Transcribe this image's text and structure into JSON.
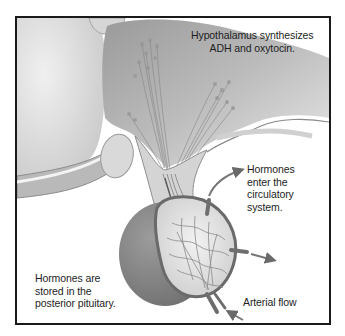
{
  "figure": {
    "labels": {
      "hypothalamus": [
        "Hypothalamus synthesizes",
        "ADH  and oxytocin."
      ],
      "circulatory": [
        "Hormones",
        "enter the",
        "circulatory",
        "system."
      ],
      "stored": [
        "Hormones are",
        "stored in  the",
        "posterior pituitary."
      ],
      "arterial": [
        "Arterial flow"
      ]
    },
    "colors": {
      "frame": "#1a1a1a",
      "tissue_light": "#e6e6e6",
      "tissue_mid": "#bdbdbd",
      "tissue_dark": "#8a8a8a",
      "vessel": "#6e6e6e",
      "text": "#1e1e1e"
    }
  }
}
